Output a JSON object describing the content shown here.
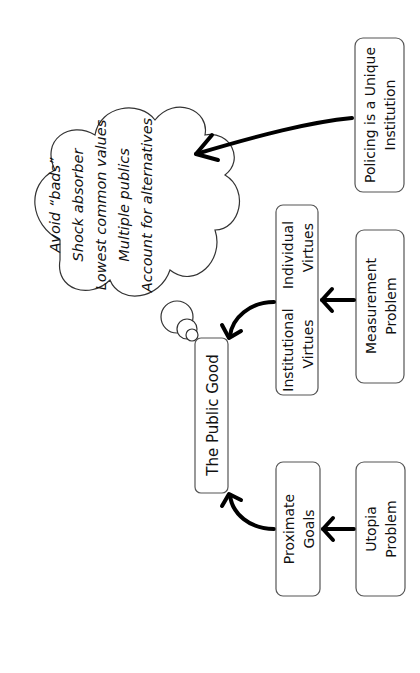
{
  "diagram": {
    "orientation": "rotated -90 degrees",
    "central_node": {
      "label": "The Public Good"
    },
    "nodes": [
      {
        "id": "proximate",
        "lines": [
          "Proximate",
          "Goals"
        ]
      },
      {
        "id": "utopia",
        "lines": [
          "Utopia",
          "Problem"
        ]
      },
      {
        "id": "institutional",
        "lines": [
          "Institutional",
          "Virtues"
        ]
      },
      {
        "id": "individual",
        "lines": [
          "Individual",
          "Virtues"
        ]
      },
      {
        "id": "measurement",
        "lines": [
          "Measurement",
          "Problem"
        ]
      },
      {
        "id": "policing",
        "lines": [
          "Policing is a Unique",
          "Institution"
        ]
      }
    ],
    "thought_bubble": {
      "lines": [
        "Avoid “bads”",
        "Shock absorber",
        "Lowest common values",
        "Multiple publics",
        "Account for alternatives"
      ]
    },
    "edges": [
      {
        "from": "utopia",
        "to": "proximate"
      },
      {
        "from": "proximate",
        "to": "the-public-good"
      },
      {
        "from": "measurement",
        "to": "virtues"
      },
      {
        "from": "virtues",
        "to": "the-public-good"
      },
      {
        "from": "policing",
        "to": "thought_bubble"
      }
    ]
  }
}
